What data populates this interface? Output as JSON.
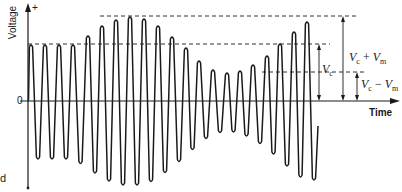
{
  "diagram": {
    "y_axis": {
      "label": "Voltage",
      "positive_marker": "+",
      "origin_label": "0"
    },
    "x_axis": {
      "label": "Time"
    },
    "annotations": {
      "vc": {
        "symbol": "V",
        "sub": "c"
      },
      "vc_plus_vm": {
        "symbol1": "V",
        "sub1": "c",
        "op": " + ",
        "symbol2": "V",
        "sub2": "m"
      },
      "vc_minus_vm": {
        "symbol1": "V",
        "sub1": "c",
        "op": " − ",
        "symbol2": "V",
        "sub2": "m"
      }
    },
    "margin_text": "d",
    "colors": {
      "stroke": "#1a1a1a",
      "background": "#ffffff"
    },
    "geometry": {
      "origin": {
        "x": 28,
        "y": 101
      },
      "y_top": 5,
      "y_bottom": 188,
      "x_end": 398,
      "vc_level_y": 44,
      "vc_plus_vm_level_y": 16,
      "vc_minus_vm_level_y": 72
    },
    "waveform": {
      "description": "Unmodulated carrier for 4 cycles at amplitude Vc, then carrier amplitude-modulated between Vc+Vm and Vc−Vm",
      "peaks": [
        {
          "x": 31,
          "amp": 57
        },
        {
          "x": 45,
          "amp": 57
        },
        {
          "x": 59,
          "amp": 57
        },
        {
          "x": 73,
          "amp": 57
        },
        {
          "x": 88,
          "amp": 66
        },
        {
          "x": 102,
          "amp": 76
        },
        {
          "x": 116,
          "amp": 82
        },
        {
          "x": 130,
          "amp": 85
        },
        {
          "x": 144,
          "amp": 83
        },
        {
          "x": 158,
          "amp": 76
        },
        {
          "x": 172,
          "amp": 65
        },
        {
          "x": 186,
          "amp": 54
        },
        {
          "x": 199,
          "amp": 41
        },
        {
          "x": 213,
          "amp": 32
        },
        {
          "x": 227,
          "amp": 29
        },
        {
          "x": 240,
          "amp": 31
        },
        {
          "x": 253,
          "amp": 37
        },
        {
          "x": 267,
          "amp": 46
        },
        {
          "x": 280,
          "amp": 58
        },
        {
          "x": 294,
          "amp": 70
        },
        {
          "x": 307,
          "amp": 80
        }
      ]
    }
  }
}
